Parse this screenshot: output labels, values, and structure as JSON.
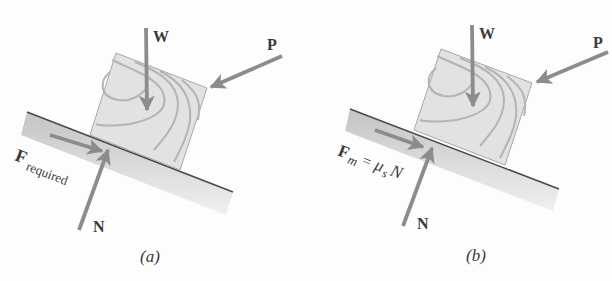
{
  "figure": {
    "panels": [
      {
        "id": "a",
        "caption": "(a)",
        "caption_letter": "a",
        "forces": {
          "weight": "W",
          "push": "P",
          "normal": "N",
          "friction_symbol": "F",
          "friction_subscript": "required"
        }
      },
      {
        "id": "b",
        "caption": "(b)",
        "caption_letter": "b",
        "forces": {
          "weight": "W",
          "push": "P",
          "normal": "N",
          "friction_symbol": "F",
          "friction_subscript": "m",
          "friction_equals": "=",
          "friction_mu": "μ",
          "friction_mu_subscript": "s",
          "friction_N": "N"
        }
      }
    ],
    "colors": {
      "arrow": "#8c8c8c",
      "block_fill": "#e2e2e2",
      "grain": "#b4b4b4",
      "incline_top": "#c8c8c8",
      "incline_bottom": "#efefef",
      "incline_edge": "#4a4a4a",
      "text": "#3a3a3a"
    }
  }
}
